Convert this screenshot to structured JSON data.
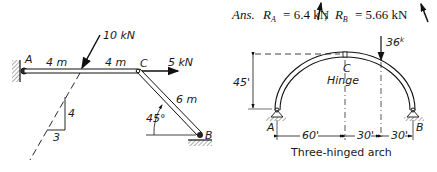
{
  "answer": {
    "prefix": "Ans.",
    "ra_label": "R",
    "ra_sub": "A",
    "ra_value": "= 6.4 kN",
    "separator": ";",
    "rb_label": "R",
    "rb_sub": "B",
    "rb_value": "= 5.66 kN"
  },
  "frame": {
    "support_a": "A",
    "joint_c": "C",
    "support_b": "B",
    "span_ac_left": "4 m",
    "span_ac_right": "4 m",
    "load_inclined": "10 kN",
    "load_horizontal": "5 kN",
    "member_cb": "6 m",
    "angle": "45°",
    "slope_rise": "4",
    "slope_run": "3"
  },
  "arch": {
    "load": "36",
    "load_unit": "k",
    "hinge_letter": "C",
    "hinge_label": "Hinge",
    "height": "45'",
    "support_a": "A",
    "support_b": "B",
    "dim_1": "60'",
    "dim_2": "30'",
    "dim_3": "30'",
    "caption": "Three-hinged arch"
  },
  "colors": {
    "ink": "#1a1a1a",
    "background": "#ffffff"
  }
}
